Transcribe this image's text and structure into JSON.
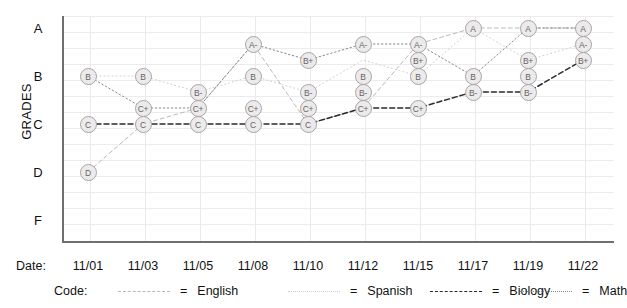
{
  "chart_data": {
    "type": "line",
    "title": "",
    "xlabel": "Date:",
    "ylabel": "GRADES",
    "grid": true,
    "legend_position": "bottom",
    "x": [
      "11/01",
      "11/03",
      "11/05",
      "11/08",
      "11/10",
      "11/12",
      "11/15",
      "11/17",
      "11/19",
      "11/22"
    ],
    "y_ticks": [
      "A",
      "B",
      "C",
      "D",
      "F"
    ],
    "y_scale_note": "Each letter band is subdivided into + / plain / - steps",
    "series": [
      {
        "name": "English",
        "code": "english",
        "line_style": "dashed",
        "color": "#b9b9b9",
        "values": [
          "D",
          "C",
          "C+",
          "A-",
          "C",
          "C+",
          "A-",
          "A",
          "A",
          "A"
        ]
      },
      {
        "name": "Spanish",
        "code": "spanish",
        "line_style": "dotted",
        "color": "#cfcfcf",
        "values": [
          "B",
          "B",
          "B-",
          "B",
          "B-",
          "B+",
          "B",
          "A",
          "B+",
          "A-"
        ]
      },
      {
        "name": "Biology",
        "code": "biology",
        "line_style": "dashed",
        "color": "#2b2b2b",
        "values": [
          "C",
          "C",
          "C",
          "C",
          "C",
          "C+",
          "C+",
          "B-",
          "B-",
          "B+"
        ]
      },
      {
        "name": "Math",
        "code": "math",
        "line_style": "dotted",
        "color": "#8a8a8a",
        "values": [
          "B",
          "C+",
          "C+",
          "A-",
          "B+",
          "A-",
          "A-",
          "B",
          "A",
          "A"
        ]
      }
    ],
    "points": [
      {
        "x": "11/01",
        "grade": "B"
      },
      {
        "x": "11/01",
        "grade": "C"
      },
      {
        "x": "11/01",
        "grade": "D"
      },
      {
        "x": "11/03",
        "grade": "B"
      },
      {
        "x": "11/03",
        "grade": "C+"
      },
      {
        "x": "11/03",
        "grade": "C"
      },
      {
        "x": "11/05",
        "grade": "B-"
      },
      {
        "x": "11/05",
        "grade": "C+"
      },
      {
        "x": "11/05",
        "grade": "C"
      },
      {
        "x": "11/08",
        "grade": "A-"
      },
      {
        "x": "11/08",
        "grade": "B"
      },
      {
        "x": "11/08",
        "grade": "C+"
      },
      {
        "x": "11/08",
        "grade": "C"
      },
      {
        "x": "11/10",
        "grade": "B+"
      },
      {
        "x": "11/10",
        "grade": "B-"
      },
      {
        "x": "11/10",
        "grade": "C+"
      },
      {
        "x": "11/10",
        "grade": "C"
      },
      {
        "x": "11/12",
        "grade": "A-"
      },
      {
        "x": "11/12",
        "grade": "B"
      },
      {
        "x": "11/12",
        "grade": "B-"
      },
      {
        "x": "11/12",
        "grade": "C+"
      },
      {
        "x": "11/15",
        "grade": "A-"
      },
      {
        "x": "11/15",
        "grade": "B+"
      },
      {
        "x": "11/15",
        "grade": "B"
      },
      {
        "x": "11/15",
        "grade": "C+"
      },
      {
        "x": "11/17",
        "grade": "A"
      },
      {
        "x": "11/17",
        "grade": "B"
      },
      {
        "x": "11/17",
        "grade": "B-"
      },
      {
        "x": "11/19",
        "grade": "A"
      },
      {
        "x": "11/19",
        "grade": "B+"
      },
      {
        "x": "11/19",
        "grade": "B"
      },
      {
        "x": "11/19",
        "grade": "B-"
      },
      {
        "x": "11/22",
        "grade": "A"
      },
      {
        "x": "11/22",
        "grade": "A-"
      },
      {
        "x": "11/22",
        "grade": "B+"
      }
    ]
  },
  "axis": {
    "y_title": "GRADES",
    "date_label": "Date:",
    "code_label": "Code:"
  },
  "legend": {
    "equals": "=",
    "items": [
      {
        "label": "English"
      },
      {
        "label": "Spanish"
      },
      {
        "label": "Biology"
      },
      {
        "label": "Math"
      }
    ]
  }
}
